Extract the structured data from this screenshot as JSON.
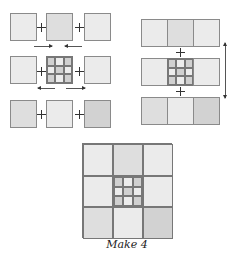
{
  "diagram": {
    "type": "quilt-block-assembly",
    "left_panel": {
      "rows": [
        {
          "squares": [
            "light",
            "mid",
            "light"
          ],
          "joiners": [
            "+",
            "+"
          ],
          "arrows": [
            "right",
            "left"
          ]
        },
        {
          "squares": [
            "light",
            "ninepatch",
            "light"
          ],
          "joiners": [
            "+",
            "+"
          ],
          "arrows": [
            "left",
            "right"
          ]
        },
        {
          "squares": [
            "mid",
            "light",
            "dark"
          ],
          "joiners": [
            "+",
            "+"
          ],
          "arrows": [
            "right",
            "left"
          ]
        }
      ]
    },
    "right_panel": {
      "rows": [
        {
          "squares": [
            "light",
            "mid",
            "light"
          ]
        },
        {
          "squares": [
            "light",
            "ninepatch",
            "light"
          ]
        },
        {
          "squares": [
            "mid",
            "light",
            "dark"
          ]
        }
      ],
      "joiners": [
        "+",
        "+"
      ],
      "arrow": "vertical-double"
    },
    "finished_block": {
      "squares": [
        "light",
        "mid",
        "light",
        "light",
        "ninepatch",
        "light",
        "mid",
        "light",
        "dark"
      ]
    },
    "caption": "Make 4"
  },
  "colors": {
    "light": "#ebebeb",
    "mid": "#dedede",
    "dark": "#d2d2d2",
    "outline": "#8a8a8a"
  }
}
